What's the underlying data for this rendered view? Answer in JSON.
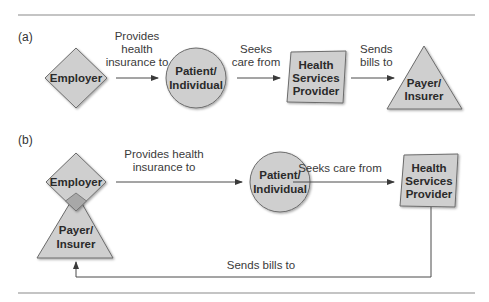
{
  "diagram": {
    "panel_a": {
      "label": "(a)",
      "nodes": {
        "employer": "Employer",
        "patient": [
          "Patient/",
          "Individual"
        ],
        "provider": [
          "Health",
          "Services",
          "Provider"
        ],
        "payer": [
          "Payer/",
          "Insurer"
        ]
      },
      "edges": {
        "employer_to_patient": [
          "Provides",
          "health",
          "insurance to"
        ],
        "patient_to_provider": [
          "Seeks",
          "care from"
        ],
        "provider_to_payer": [
          "Sends",
          "bills to"
        ]
      }
    },
    "panel_b": {
      "label": "(b)",
      "nodes": {
        "employer": "Employer",
        "payer": [
          "Payer/",
          "Insurer"
        ],
        "patient": [
          "Patient/",
          "Individual"
        ],
        "provider": [
          "Health",
          "Services",
          "Provider"
        ]
      },
      "edges": {
        "employer_to_patient": [
          "Provides health",
          "insurance to"
        ],
        "patient_to_provider": [
          "Seeks care from"
        ],
        "provider_to_payer": [
          "Sends bills to"
        ]
      }
    },
    "colors": {
      "shape_fill": "#cfcfcf",
      "overlap_fill": "#a8a8a8",
      "stroke": "#6b6b6b"
    }
  }
}
